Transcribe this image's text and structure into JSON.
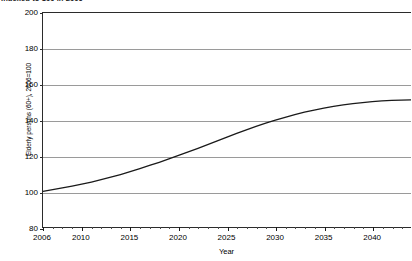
{
  "subtitle": "Indexed to 100 in 2006",
  "chart_data": {
    "type": "line",
    "title": "",
    "subtitle": "Indexed to 100 in 2006",
    "xlabel": "Year",
    "ylabel": "Elderly persons (60+), 2006=100",
    "xlim": [
      2006,
      2044
    ],
    "ylim": [
      80,
      200
    ],
    "grid": true,
    "legend": false,
    "yticks": [
      200,
      180,
      160,
      140,
      120,
      100,
      80
    ],
    "xticks": [
      2006,
      2010,
      2015,
      2020,
      2025,
      2030,
      2035,
      2040
    ],
    "x_minor_tick_step": 1,
    "line_color": "#1a1a1a",
    "grid_color": "#9a9a9a",
    "series": [
      {
        "name": "Elderly persons (60+)",
        "x": [
          2006,
          2007,
          2008,
          2009,
          2010,
          2011,
          2012,
          2013,
          2014,
          2015,
          2016,
          2017,
          2018,
          2019,
          2020,
          2021,
          2022,
          2023,
          2024,
          2025,
          2026,
          2027,
          2028,
          2029,
          2030,
          2031,
          2032,
          2033,
          2034,
          2035,
          2036,
          2037,
          2038,
          2039,
          2040,
          2041,
          2042,
          2043,
          2044
        ],
        "values": [
          100.0,
          100.9,
          101.9,
          102.9,
          104.0,
          105.2,
          106.5,
          107.9,
          109.4,
          111.0,
          112.7,
          114.5,
          116.3,
          118.2,
          120.1,
          122.1,
          124.1,
          126.2,
          128.3,
          130.4,
          132.5,
          134.5,
          136.4,
          138.2,
          139.9,
          141.5,
          143.0,
          144.4,
          145.6,
          146.7,
          147.7,
          148.5,
          149.2,
          149.8,
          150.3,
          150.7,
          151.0,
          151.2,
          151.3
        ]
      }
    ]
  }
}
